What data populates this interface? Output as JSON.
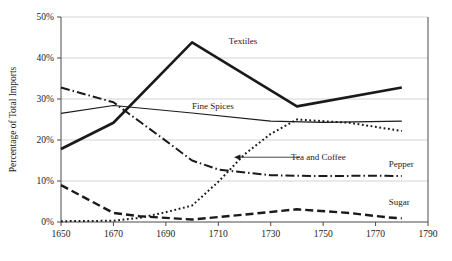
{
  "chart_data": {
    "type": "line",
    "title": "",
    "subtitle": "",
    "xlabel": "",
    "ylabel": "Percentage of Total Imports",
    "xlim": [
      1650,
      1790
    ],
    "ylim": [
      0,
      50
    ],
    "grid": true,
    "grid_axis": "y",
    "legend": "inline-labels",
    "x_ticks": [
      "1650",
      "1670",
      "1690",
      "1710",
      "1730",
      "1750",
      "1770",
      "1790"
    ],
    "x_tick_values": [
      1650,
      1670,
      1690,
      1710,
      1730,
      1750,
      1770,
      1790
    ],
    "y_ticks": [
      "0%",
      "10%",
      "20%",
      "30%",
      "40%",
      "50%"
    ],
    "y_tick_values": [
      0,
      10,
      20,
      30,
      40,
      50
    ],
    "series": [
      {
        "name": "Textiles",
        "style": "solid-thick",
        "label_x": 1714,
        "label_y": 43.5,
        "x": [
          1650,
          1670,
          1700,
          1740,
          1780
        ],
        "values": [
          17.8,
          24.2,
          43.8,
          28.2,
          32.8
        ]
      },
      {
        "name": "Fine Spices",
        "style": "solid-thin",
        "label_x": 1700,
        "label_y": 27.5,
        "x": [
          1650,
          1670,
          1700,
          1730,
          1750,
          1780
        ],
        "values": [
          26.5,
          28.4,
          26.6,
          24.6,
          24.3,
          24.6
        ]
      },
      {
        "name": "Pepper",
        "style": "dash-dot",
        "label_x": 1775,
        "label_y": 13.5,
        "x": [
          1650,
          1670,
          1680,
          1690,
          1700,
          1710,
          1730,
          1750,
          1770,
          1780
        ],
        "values": [
          32.8,
          29.2,
          24.5,
          19.8,
          15.0,
          12.8,
          11.4,
          11.2,
          11.3,
          11.2
        ]
      },
      {
        "name": "Tea and Coffee",
        "style": "dotted",
        "label_x": 1737,
        "label_y": 15.8,
        "x": [
          1650,
          1670,
          1680,
          1690,
          1700,
          1710,
          1720,
          1730,
          1740,
          1760,
          1780
        ],
        "values": [
          0.2,
          0.3,
          1.0,
          2.4,
          4.0,
          9.8,
          16.5,
          21.5,
          25.0,
          24.2,
          22.2
        ]
      },
      {
        "name": "Sugar",
        "style": "long-dash",
        "label_x": 1775,
        "label_y": 4.2,
        "x": [
          1650,
          1670,
          1680,
          1700,
          1720,
          1740,
          1760,
          1775,
          1780
        ],
        "values": [
          9.0,
          2.2,
          1.4,
          0.6,
          1.8,
          3.1,
          2.2,
          1.1,
          0.9
        ]
      }
    ],
    "annotations": [
      {
        "text": "Tea and Coffee",
        "arrow": true,
        "arrow_from_x": 1741,
        "arrow_from_y": 15.8,
        "arrow_to_x": 1716,
        "arrow_to_y": 15.8
      }
    ]
  }
}
